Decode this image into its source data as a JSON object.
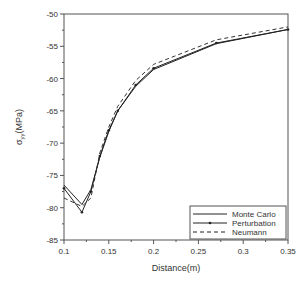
{
  "chart_data": {
    "type": "line",
    "title": "",
    "xlabel": "Distance(m)",
    "ylabel": "σ_yy(MPa)",
    "xlim": [
      0.1,
      0.35
    ],
    "ylim": [
      -85,
      -50
    ],
    "xticks": [
      "0.1",
      "0.15",
      "0.2",
      "0.25",
      "0.3",
      "0.35"
    ],
    "yticks": [
      "-50",
      "-55",
      "-60",
      "-65",
      "-70",
      "-75",
      "-80",
      "-85"
    ],
    "grid": false,
    "legend_position": "lower right",
    "x": [
      0.1,
      0.12,
      0.13,
      0.14,
      0.15,
      0.16,
      0.18,
      0.2,
      0.27,
      0.35
    ],
    "series": [
      {
        "name": "Monte Carlo",
        "style": "solid",
        "values": [
          -76.5,
          -79.5,
          -77.2,
          -72.2,
          -68.2,
          -65.0,
          -61.2,
          -58.6,
          -54.6,
          -52.4
        ]
      },
      {
        "name": "Perturbation",
        "style": "solid-marker",
        "values": [
          -77.0,
          -80.7,
          -77.5,
          -72.0,
          -68.0,
          -65.0,
          -61.0,
          -58.4,
          -54.5,
          -52.4
        ]
      },
      {
        "name": "Neumann",
        "style": "dashed",
        "values": [
          -78.5,
          -79.8,
          -78.5,
          -71.5,
          -67.5,
          -64.3,
          -60.3,
          -57.8,
          -54.0,
          -52.0
        ]
      }
    ]
  }
}
